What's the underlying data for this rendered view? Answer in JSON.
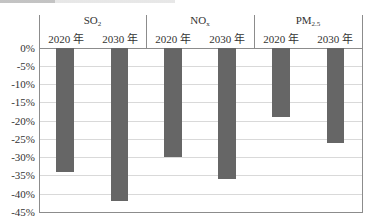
{
  "chart_data": {
    "type": "bar",
    "title": "",
    "xlabel": "",
    "ylabel": "",
    "ylim": [
      -45,
      0
    ],
    "yticks": [
      "0%",
      "-5%",
      "-10%",
      "-15%",
      "-20%",
      "-25%",
      "-30%",
      "-35%",
      "-40%",
      "-45%"
    ],
    "grid": true,
    "legend": "none",
    "groups": [
      {
        "name": "SO2",
        "base": "SO",
        "sub": "2",
        "categories": [
          "2020 年",
          "2030 年"
        ],
        "values": [
          -34,
          -42
        ]
      },
      {
        "name": "NOx",
        "base": "NO",
        "sub": "x",
        "categories": [
          "2020 年",
          "2030 年"
        ],
        "values": [
          -30,
          -36
        ]
      },
      {
        "name": "PM2.5",
        "base": "PM",
        "sub": "2.5",
        "categories": [
          "2020 年",
          "2030 年"
        ],
        "values": [
          -19,
          -26
        ]
      }
    ],
    "categories": [
      "SO2 2020 年",
      "SO2 2030 年",
      "NOx 2020 年",
      "NOx 2030 年",
      "PM2.5 2020 年",
      "PM2.5 2030 年"
    ],
    "values": [
      -34,
      -42,
      -30,
      -36,
      -19,
      -26
    ],
    "bar_color": "#666666"
  },
  "labels": {
    "groups": [
      {
        "base": "SO",
        "sub": "2"
      },
      {
        "base": "NO",
        "sub": "x"
      },
      {
        "base": "PM",
        "sub": "2.5"
      }
    ],
    "years": [
      "2020 年",
      "2030 年",
      "2020 年",
      "2030 年",
      "2020 年",
      "2030 年"
    ],
    "yticks": [
      "0%",
      "-5%",
      "-10%",
      "-15%",
      "-20%",
      "-25%",
      "-30%",
      "-35%",
      "-40%",
      "-45%"
    ]
  }
}
